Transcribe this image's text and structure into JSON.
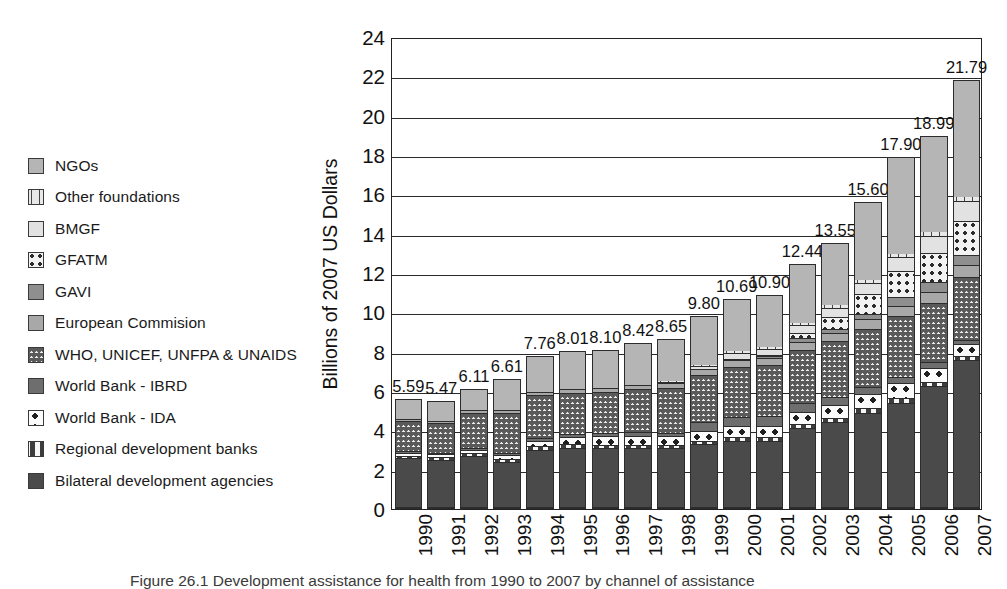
{
  "figure": {
    "caption": "Figure 26.1  Development assistance for health from 1990 to 2007 by channel of assistance"
  },
  "legend": {
    "items": [
      {
        "label": "NGOs",
        "key": "ngos",
        "swatch": "p-ngos",
        "color": "#b5b5b5"
      },
      {
        "label": "Other foundations",
        "key": "otherfound",
        "swatch": "p-otherfound",
        "color": "#e8e8e8"
      },
      {
        "label": "BMGF",
        "key": "bmgf",
        "swatch": "p-bmgf",
        "color": "#e2e2e2"
      },
      {
        "label": "GFATM",
        "key": "gfatm",
        "swatch": "p-gfatm",
        "color": "#f2f2f2"
      },
      {
        "label": "GAVI",
        "key": "gavi",
        "swatch": "p-gavi",
        "color": "#8f8f8f"
      },
      {
        "label": "European Commision",
        "key": "eurocom",
        "swatch": "p-eurocom",
        "color": "#a8a8a8"
      },
      {
        "label": "WHO, UNICEF, UNFPA & UNAIDS",
        "key": "who",
        "swatch": "p-who",
        "color": "#ececec"
      },
      {
        "label": "World Bank - IBRD",
        "key": "ibrd",
        "swatch": "p-ibrd",
        "color": "#6e6e6e"
      },
      {
        "label": "World Bank - IDA",
        "key": "ida",
        "swatch": "p-ida",
        "color": "#fbfbfb"
      },
      {
        "label": "Regional development banks",
        "key": "regional",
        "swatch": "p-regional",
        "color": "#f7f7f7"
      },
      {
        "label": "Bilateral development agencies",
        "key": "bilateral",
        "swatch": "p-bilateral",
        "color": "#4a4a4a"
      }
    ]
  },
  "chart_data": {
    "type": "bar",
    "stacked": true,
    "title": "",
    "xlabel": "",
    "ylabel": "Billions of 2007 US Dollars",
    "ylim": [
      0,
      24
    ],
    "yticks": [
      0,
      2,
      4,
      6,
      8,
      10,
      12,
      14,
      16,
      18,
      20,
      22,
      24
    ],
    "ytick_labels": [
      "0",
      "2",
      "4",
      "6",
      "8",
      "10",
      "12",
      "14",
      "16",
      "18",
      "20",
      "22",
      "24"
    ],
    "grid": true,
    "legend_position": "left",
    "categories": [
      "1990",
      "1991",
      "1992",
      "1993",
      "1994",
      "1995",
      "1996",
      "1997",
      "1998",
      "1999",
      "2000",
      "2001",
      "2002",
      "2003",
      "2004",
      "2005",
      "2006",
      "2007"
    ],
    "totals": [
      5.59,
      5.47,
      6.11,
      6.61,
      7.76,
      8.01,
      8.1,
      8.42,
      8.65,
      9.8,
      10.69,
      10.9,
      12.44,
      13.55,
      15.6,
      17.9,
      18.99,
      21.79
    ],
    "total_labels": [
      "5.59",
      "5.47",
      "6.11",
      "6.61",
      "7.76",
      "8.01",
      "8.10",
      "8.42",
      "8.65",
      "9.80",
      "10.69",
      "10.90",
      "12.44",
      "13.55",
      "15.60",
      "17.90",
      "18.99",
      "21.79"
    ],
    "series": [
      {
        "name": "Bilateral development agencies",
        "key": "bilateral",
        "values": [
          2.48,
          2.38,
          2.6,
          2.28,
          2.9,
          3.02,
          3.0,
          3.0,
          3.02,
          3.2,
          3.38,
          3.35,
          4.0,
          4.32,
          4.8,
          5.3,
          6.15,
          7.45
        ]
      },
      {
        "name": "Regional development banks",
        "key": "regional",
        "values": [
          0.12,
          0.14,
          0.13,
          0.15,
          0.18,
          0.18,
          0.17,
          0.16,
          0.15,
          0.18,
          0.2,
          0.2,
          0.22,
          0.22,
          0.22,
          0.22,
          0.2,
          0.22
        ]
      },
      {
        "name": "World Bank - IDA",
        "key": "ida",
        "values": [
          0.15,
          0.16,
          0.18,
          0.22,
          0.3,
          0.35,
          0.42,
          0.45,
          0.42,
          0.48,
          0.52,
          0.55,
          0.6,
          0.66,
          0.72,
          0.78,
          0.72,
          0.62
        ]
      },
      {
        "name": "World Bank - IBRD",
        "key": "ibrd",
        "values": [
          0.08,
          0.08,
          0.08,
          0.1,
          0.12,
          0.14,
          0.18,
          0.18,
          0.18,
          0.45,
          0.5,
          0.52,
          0.48,
          0.42,
          0.38,
          0.32,
          0.28,
          0.22
        ]
      },
      {
        "name": "WHO, UNICEF, UNFPA & UNAIDS",
        "key": "who",
        "values": [
          1.55,
          1.5,
          1.8,
          2.05,
          2.18,
          2.12,
          2.1,
          2.2,
          2.3,
          2.42,
          2.52,
          2.58,
          2.7,
          2.8,
          2.95,
          3.1,
          3.05,
          3.2
        ]
      },
      {
        "name": "European Commision",
        "key": "eurocom",
        "values": [
          0.1,
          0.1,
          0.12,
          0.14,
          0.16,
          0.18,
          0.18,
          0.2,
          0.22,
          0.28,
          0.35,
          0.38,
          0.4,
          0.42,
          0.48,
          0.52,
          0.55,
          0.58
        ]
      },
      {
        "name": "GAVI",
        "key": "gavi",
        "values": [
          0.0,
          0.0,
          0.0,
          0.0,
          0.0,
          0.0,
          0.0,
          0.0,
          0.0,
          0.0,
          0.08,
          0.12,
          0.18,
          0.22,
          0.28,
          0.42,
          0.48,
          0.52
        ]
      },
      {
        "name": "GFATM",
        "key": "gfatm",
        "values": [
          0.0,
          0.0,
          0.0,
          0.0,
          0.0,
          0.0,
          0.0,
          0.0,
          0.0,
          0.0,
          0.0,
          0.05,
          0.28,
          0.62,
          1.0,
          1.35,
          1.48,
          1.72
        ]
      },
      {
        "name": "BMGF",
        "key": "bmgf",
        "values": [
          0.0,
          0.0,
          0.0,
          0.0,
          0.0,
          0.0,
          0.0,
          0.0,
          0.02,
          0.15,
          0.28,
          0.3,
          0.38,
          0.45,
          0.58,
          0.7,
          0.88,
          1.05
        ]
      },
      {
        "name": "Other foundations",
        "key": "otherfound",
        "values": [
          0.06,
          0.06,
          0.06,
          0.07,
          0.08,
          0.08,
          0.08,
          0.09,
          0.1,
          0.12,
          0.14,
          0.15,
          0.16,
          0.18,
          0.2,
          0.22,
          0.24,
          0.26
        ]
      },
      {
        "name": "NGOs",
        "key": "ngos",
        "values": [
          1.05,
          1.05,
          1.14,
          1.6,
          1.84,
          1.94,
          1.97,
          2.14,
          2.24,
          2.52,
          2.72,
          2.7,
          3.04,
          3.24,
          3.99,
          4.97,
          4.96,
          5.95
        ]
      }
    ]
  }
}
